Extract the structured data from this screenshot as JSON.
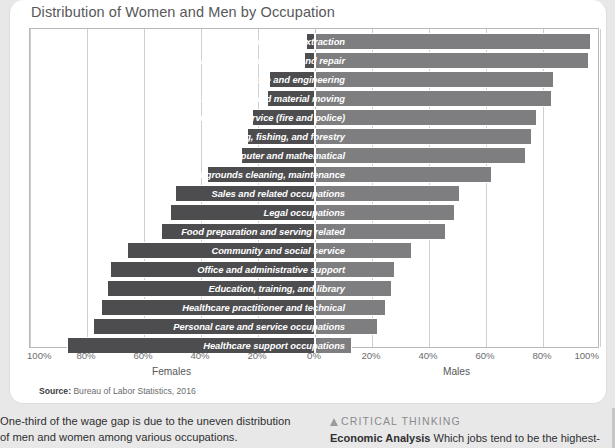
{
  "figure": {
    "title": "Distribution of Women and Men by Occupation",
    "source_prefix": "Source:",
    "source_text": " Bureau of Labor Statistics, 2016"
  },
  "axis": {
    "left_label": "Females",
    "right_label": "Males",
    "ticks": [
      "100%",
      "80%",
      "60%",
      "40%",
      "20%",
      "0%",
      "20%",
      "40%",
      "60%",
      "80%",
      "100%"
    ]
  },
  "body": {
    "left_paragraph": "One-third of the wage gap is due to the uneven distribution of men and women among various occupations.",
    "critical_thinking_heading": "CRITICAL THINKING",
    "critical_thinking_lead": "Economic Analysis",
    "critical_thinking_text": " Which jobs tend to be the highest-paying jobs?"
  },
  "chart_data": {
    "type": "bar",
    "subtype": "diverging-horizontal-stacked-100",
    "title": "Distribution of Women and Men by Occupation",
    "xlabel": "",
    "ylabel": "",
    "xlim": [
      -100,
      100
    ],
    "xticks": [
      -100,
      -80,
      -60,
      -40,
      -20,
      0,
      20,
      40,
      60,
      80,
      100
    ],
    "xtick_labels": [
      "100%",
      "80%",
      "60%",
      "40%",
      "20%",
      "0%",
      "20%",
      "40%",
      "60%",
      "80%",
      "100%"
    ],
    "grid": true,
    "legend": "none",
    "side_labels": {
      "left": "Females",
      "right": "Males"
    },
    "colors": {
      "female": "#4d4d4f",
      "male": "#7e7e80"
    },
    "categories": [
      "Construction and extraction",
      "Installation, maintenance, and repair",
      "Architecture and engineering",
      "Transportation and material moving",
      "Protective service (fire and police)",
      "Farming, fishing, and forestry",
      "Computer and mathematical",
      "Building and grounds cleaning, maintenance",
      "Sales and related occupations",
      "Legal occupations",
      "Food preparation and serving related",
      "Community and social service",
      "Office and administrative support",
      "Education, training, and library",
      "Healthcare practitioner and technical",
      "Personal care and service occupations",
      "Healthcare support occupations"
    ],
    "series": [
      {
        "name": "Females",
        "values": [
          3,
          4,
          16,
          17,
          22,
          24,
          26,
          38,
          49,
          51,
          54,
          66,
          72,
          73,
          75,
          78,
          87
        ]
      },
      {
        "name": "Males",
        "values": [
          97,
          96,
          84,
          83,
          78,
          76,
          74,
          62,
          51,
          49,
          46,
          34,
          28,
          27,
          25,
          22,
          13
        ]
      }
    ]
  }
}
